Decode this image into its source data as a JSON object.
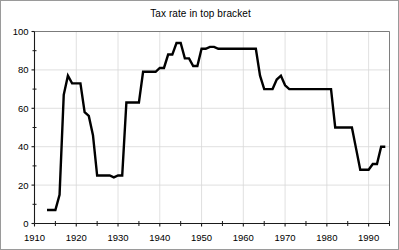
{
  "chart_data": {
    "type": "line",
    "title": "Tax rate in top bracket",
    "xlabel": "",
    "ylabel": "",
    "xlim": [
      1910,
      1995
    ],
    "ylim": [
      0,
      100
    ],
    "grid": true,
    "legend": "none",
    "x_ticks": [
      1910,
      1920,
      1930,
      1940,
      1950,
      1960,
      1970,
      1980,
      1990
    ],
    "x_tick_labels": [
      "1910",
      "1920",
      "1930",
      "1940",
      "1950",
      "1960",
      "1970",
      "1980",
      "1990"
    ],
    "x_minor_ticks": [
      1915,
      1925,
      1935,
      1945,
      1955,
      1965,
      1975,
      1985,
      1995
    ],
    "y_ticks": [
      0,
      20,
      40,
      60,
      80,
      100
    ],
    "y_tick_labels": [
      "0",
      "20",
      "40",
      "60",
      "80",
      "100"
    ],
    "y_minor_ticks": [
      10,
      30,
      50,
      70,
      90
    ],
    "line_color": "#000000",
    "series": [
      {
        "name": "Top marginal tax rate",
        "x": [
          1913,
          1914,
          1915,
          1916,
          1917,
          1918,
          1919,
          1920,
          1921,
          1922,
          1923,
          1924,
          1925,
          1926,
          1927,
          1928,
          1929,
          1930,
          1931,
          1932,
          1933,
          1934,
          1935,
          1936,
          1937,
          1938,
          1939,
          1940,
          1941,
          1942,
          1943,
          1944,
          1945,
          1946,
          1947,
          1948,
          1949,
          1950,
          1951,
          1952,
          1953,
          1954,
          1955,
          1956,
          1957,
          1958,
          1959,
          1960,
          1961,
          1962,
          1963,
          1964,
          1965,
          1966,
          1967,
          1968,
          1969,
          1970,
          1971,
          1972,
          1973,
          1974,
          1975,
          1976,
          1977,
          1978,
          1979,
          1980,
          1981,
          1982,
          1983,
          1984,
          1985,
          1986,
          1987,
          1988,
          1989,
          1990,
          1991,
          1992,
          1993,
          1994
        ],
        "y": [
          7,
          7,
          7,
          15,
          67,
          77,
          73,
          73,
          73,
          58,
          56,
          46,
          25,
          25,
          25,
          25,
          24,
          25,
          25,
          63,
          63,
          63,
          63,
          79,
          79,
          79,
          79,
          81,
          81,
          88,
          88,
          94,
          94,
          86,
          86,
          82,
          82,
          91,
          91,
          92,
          92,
          91,
          91,
          91,
          91,
          91,
          91,
          91,
          91,
          91,
          91,
          77,
          70,
          70,
          70,
          75,
          77,
          72,
          70,
          70,
          70,
          70,
          70,
          70,
          70,
          70,
          70,
          70,
          70,
          50,
          50,
          50,
          50,
          50,
          39,
          28,
          28,
          28,
          31,
          31,
          40,
          40
        ]
      }
    ]
  },
  "axes": {
    "frame_color": "#6f6f6f",
    "grid_color": "#d8d8d8"
  }
}
